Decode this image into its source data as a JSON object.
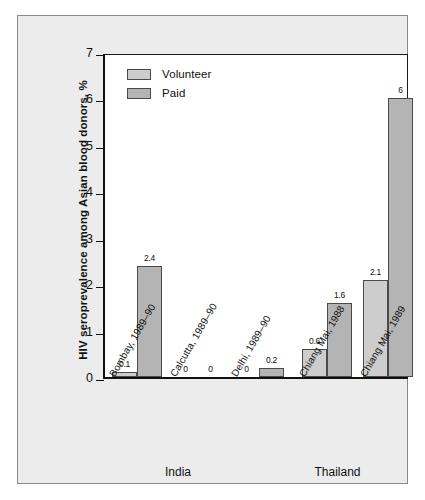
{
  "chart_data": {
    "type": "bar",
    "title": "",
    "xlabel": "",
    "ylabel": "HIV seroprevalence among Asian blood donors, %",
    "ylim": [
      0,
      7
    ],
    "yticks": [
      0,
      1,
      2,
      3,
      4,
      5,
      6,
      7
    ],
    "ytick_labels": [
      "0",
      "1",
      "2",
      "3",
      "4",
      "5",
      "6",
      "7"
    ],
    "grid": false,
    "legend_position": "top-left",
    "categories": [
      "Bombay, 1989–90",
      "Calcutta, 1989–90",
      "Delhi, 1989–90",
      "Chiang Mai, 1988",
      "Chiang Mai, 1989"
    ],
    "series": [
      {
        "name": "Volunteer",
        "color": "#cdcdcd",
        "values": [
          0.1,
          0,
          0,
          0.6,
          2.1
        ],
        "value_labels": [
          "0.1",
          "0",
          "0",
          "0.6",
          "2.1"
        ]
      },
      {
        "name": "Paid",
        "color": "#b4b4b4",
        "values": [
          2.4,
          0,
          0.2,
          1.6,
          6
        ],
        "value_labels": [
          "2.4",
          "0",
          "0.2",
          "1.6",
          "6"
        ]
      }
    ],
    "groups": [
      {
        "label": "India",
        "categories": [
          "Bombay, 1989–90",
          "Calcutta, 1989–90",
          "Delhi, 1989–90"
        ]
      },
      {
        "label": "Thailand",
        "categories": [
          "Chiang Mai, 1988",
          "Chiang Mai, 1989"
        ]
      }
    ]
  },
  "legend": {
    "items": [
      {
        "label": "Volunteer",
        "color": "#cdcdcd"
      },
      {
        "label": "Paid",
        "color": "#b4b4b4"
      }
    ]
  },
  "axis": {
    "y_title": "HIV seroprevalence among Asian blood donors, %",
    "y_ticks": [
      "7",
      "6",
      "5",
      "4",
      "3",
      "2",
      "1",
      "0"
    ]
  },
  "groups": [
    {
      "label": "India"
    },
    {
      "label": "Thailand"
    }
  ],
  "colors": {
    "volunteer": "#cdcdcd",
    "paid": "#b4b4b4",
    "panel_background": "#ececec",
    "plot_background": "#ffffff",
    "axis": "#111111",
    "bar_border": "#4a4a4a"
  }
}
